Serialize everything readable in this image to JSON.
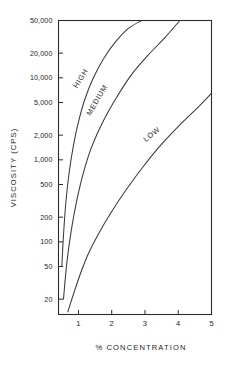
{
  "chart_data": {
    "type": "line",
    "title": "",
    "xlabel": "% CONCENTRATION",
    "ylabel": "VISCOSITY (CPS)",
    "xscale": "linear",
    "yscale": "log",
    "xlim": [
      0.4,
      5
    ],
    "ylim": [
      13,
      50000
    ],
    "grid": false,
    "legend_position": "inline-curve-labels",
    "xticks": [
      1,
      2,
      3,
      4,
      5
    ],
    "xtick_labels": [
      "1",
      "2",
      "3",
      "4",
      "5"
    ],
    "yticks": [
      50000,
      20000,
      10000,
      5000,
      2000,
      1000,
      500,
      200,
      100,
      50,
      20
    ],
    "ytick_labels": [
      "50,000",
      "20,000",
      "10,000",
      "5,000",
      "2,000",
      "1,000",
      "500",
      "200",
      "100",
      "50",
      "20"
    ],
    "series": [
      {
        "name": "HIGH",
        "label": "HIGH",
        "x": [
          0.5,
          0.55,
          0.62,
          0.72,
          0.85,
          1.0,
          1.2,
          1.45,
          1.75,
          2.1,
          2.5,
          2.9
        ],
        "values": [
          50,
          120,
          300,
          700,
          1500,
          2900,
          5600,
          10000,
          17000,
          27000,
          40000,
          50000
        ]
      },
      {
        "name": "MEDIUM",
        "label": "MEDIUM",
        "x": [
          0.55,
          0.65,
          0.78,
          0.95,
          1.15,
          1.4,
          1.75,
          2.15,
          2.6,
          3.1,
          3.6,
          4.05
        ],
        "values": [
          20,
          55,
          135,
          320,
          700,
          1450,
          3000,
          5800,
          11000,
          19000,
          31000,
          50000
        ]
      },
      {
        "name": "LOW",
        "label": "LOW",
        "x": [
          0.68,
          0.85,
          1.05,
          1.3,
          1.6,
          2.0,
          2.45,
          2.95,
          3.5,
          4.1,
          4.6,
          5.0
        ],
        "values": [
          14,
          23,
          40,
          72,
          125,
          235,
          440,
          830,
          1550,
          2800,
          4400,
          6500
        ]
      }
    ],
    "annotations": [
      {
        "text": "HIGH",
        "x": 1.13,
        "y": 9500,
        "rotation": -58
      },
      {
        "text": "MEDIUM",
        "x": 1.62,
        "y": 5200,
        "rotation": -60
      },
      {
        "text": "LOW",
        "x": 3.25,
        "y": 1950,
        "rotation": -40
      }
    ]
  }
}
